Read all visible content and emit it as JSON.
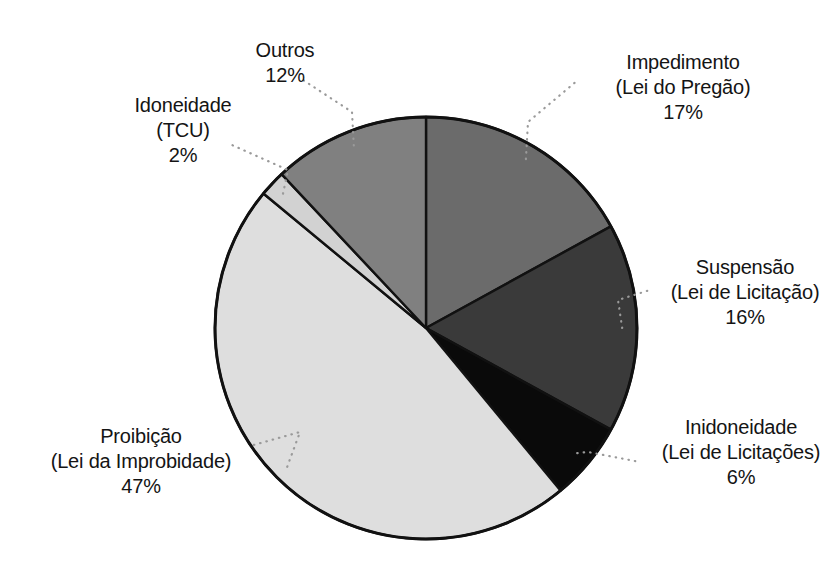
{
  "chart_data": {
    "type": "pie",
    "title": "",
    "xlabel": "",
    "ylabel": "",
    "legend_position": "none",
    "grid": false,
    "units": "%",
    "start_angle_deg": 0,
    "direction": "clockwise",
    "categories": [
      "Impedimento (Lei do Pregão)",
      "Suspensão (Lei de Licitação)",
      "Inidoneidade (Lei de Licitações)",
      "Proibição (Lei da Improbidade)",
      "Idoneidade (TCU)",
      "Outros"
    ],
    "values": [
      17,
      16,
      6,
      47,
      2,
      12
    ],
    "total": 100,
    "slices": [
      {
        "key": "impedimento",
        "name": "Impedimento",
        "sub": "(Lei do Pregão)",
        "pct": "17%",
        "value": 17,
        "color": "#6b6b6b"
      },
      {
        "key": "suspensao",
        "name": "Suspensão",
        "sub": "(Lei de Licitação)",
        "pct": "16%",
        "value": 16,
        "color": "#3a3a3a"
      },
      {
        "key": "inidoneidade",
        "name": "Inidoneidade",
        "sub": "(Lei de Licitações)",
        "pct": "6%",
        "value": 6,
        "color": "#0a0a0a"
      },
      {
        "key": "proibicao",
        "name": "Proibição",
        "sub": "(Lei da Improbidade)",
        "pct": "47%",
        "value": 47,
        "color": "#dedede"
      },
      {
        "key": "idoneidade",
        "name": "Idoneidade",
        "sub": "(TCU)",
        "pct": "2%",
        "value": 2,
        "color": "#d2d2d2"
      },
      {
        "key": "outros",
        "name": "Outros",
        "sub": "",
        "pct": "12%",
        "value": 12,
        "color": "#808080"
      }
    ],
    "style": {
      "background": "#ffffff",
      "outline": "#111111",
      "leader_line": "#9a9a9a",
      "text": "#141414"
    },
    "geometry": {
      "center_x": 426,
      "center_y": 328,
      "radius": 211
    }
  }
}
